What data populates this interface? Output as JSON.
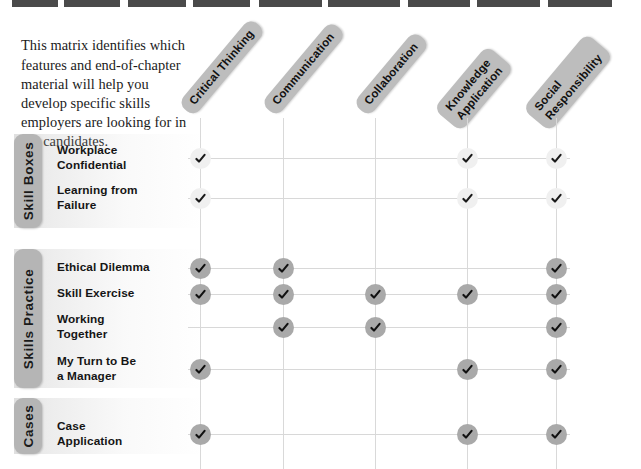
{
  "intro": {
    "text": "This matrix identifies which features and end-of-chapter material will help you develop specific skills employers are looking for in job candidates."
  },
  "colors": {
    "header_pill": "#bdbdbd",
    "group_tab": "#b5b5b5",
    "mark_light": "#f0f0f0",
    "mark_dark": "#a9a9a9",
    "rule": "#d8d8d8",
    "text": "#151515",
    "top_band": "#4a4a4a"
  },
  "columns": [
    {
      "id": "critical-thinking",
      "label": "Critical Thinking",
      "lines": [
        "Critical Thinking"
      ],
      "cx": 200
    },
    {
      "id": "communication",
      "label": "Communication",
      "lines": [
        "Communication"
      ],
      "cx": 283
    },
    {
      "id": "collaboration",
      "label": "Collaboration",
      "lines": [
        "Collaboration"
      ],
      "cx": 375
    },
    {
      "id": "knowledge-application",
      "label": "Knowledge Application",
      "lines": [
        "Knowledge",
        "Application"
      ],
      "cx": 467
    },
    {
      "id": "social-responsibility",
      "label": "Social Responsibility",
      "lines": [
        "Social",
        "Responsibility"
      ],
      "cx": 556
    }
  ],
  "groups": [
    {
      "id": "skill-boxes",
      "label": "Skill Boxes",
      "mark_style": "light",
      "top": 134,
      "height": 94,
      "rows": [
        {
          "id": "workplace-confidential",
          "lines": [
            "Workplace",
            "Confidential"
          ],
          "y": 158,
          "marks": [
            true,
            false,
            false,
            true,
            true
          ]
        },
        {
          "id": "learning-from-failure",
          "lines": [
            "Learning from",
            "Failure"
          ],
          "y": 198,
          "marks": [
            true,
            false,
            false,
            true,
            true
          ]
        }
      ]
    },
    {
      "id": "skills-practice",
      "label": "Skills Practice",
      "mark_style": "dark",
      "top": 249,
      "height": 139,
      "rows": [
        {
          "id": "ethical-dilemma",
          "lines": [
            "Ethical Dilemma"
          ],
          "y": 268,
          "marks": [
            true,
            true,
            false,
            false,
            true
          ]
        },
        {
          "id": "skill-exercise",
          "lines": [
            "Skill Exercise"
          ],
          "y": 294,
          "marks": [
            true,
            true,
            true,
            true,
            true
          ]
        },
        {
          "id": "working-together",
          "lines": [
            "Working",
            "Together"
          ],
          "y": 327,
          "marks": [
            false,
            true,
            true,
            false,
            true
          ]
        },
        {
          "id": "my-turn-to-be-a-manager",
          "lines": [
            "My Turn to Be",
            "a Manager"
          ],
          "y": 369,
          "marks": [
            true,
            false,
            false,
            true,
            true
          ]
        }
      ]
    },
    {
      "id": "cases",
      "label": "Cases",
      "mark_style": "dark",
      "top": 398,
      "height": 56,
      "rows": [
        {
          "id": "case-application",
          "lines": [
            "Case",
            "Application"
          ],
          "y": 434,
          "marks": [
            true,
            false,
            false,
            true,
            true
          ]
        }
      ]
    }
  ],
  "icons": {
    "check": "check-icon"
  }
}
